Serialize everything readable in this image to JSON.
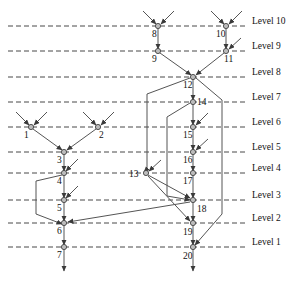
{
  "diagram": {
    "colors": {
      "edge": "#555555",
      "node_fill": "#bdbdbd",
      "node_stroke": "#444444",
      "level_line": "#333333",
      "text": "#111111",
      "background": "#ffffff"
    },
    "levels": [
      {
        "label": "Level 10",
        "y": 26
      },
      {
        "label": "Level 9",
        "y": 51
      },
      {
        "label": "Level 8",
        "y": 77
      },
      {
        "label": "Level 7",
        "y": 102
      },
      {
        "label": "Level 6",
        "y": 127
      },
      {
        "label": "Level 5",
        "y": 152
      },
      {
        "label": "Level 4",
        "y": 173
      },
      {
        "label": "Level 3",
        "y": 200
      },
      {
        "label": "Level 2",
        "y": 223
      },
      {
        "label": "Level 1",
        "y": 247
      }
    ],
    "level_line": {
      "x1": 8,
      "x2": 248,
      "label_x": 252
    },
    "nodes": [
      {
        "id": "1",
        "x": 31,
        "y": 127,
        "label": "1",
        "lx": 24,
        "ly": 130
      },
      {
        "id": "2",
        "x": 98,
        "y": 127,
        "label": "2",
        "lx": 99,
        "ly": 130
      },
      {
        "id": "3",
        "x": 64,
        "y": 152,
        "label": "3",
        "lx": 57,
        "ly": 155
      },
      {
        "id": "4",
        "x": 64,
        "y": 173,
        "label": "4",
        "lx": 57,
        "ly": 176
      },
      {
        "id": "5",
        "x": 64,
        "y": 200,
        "label": "5",
        "lx": 57,
        "ly": 203
      },
      {
        "id": "6",
        "x": 64,
        "y": 223,
        "label": "6",
        "lx": 57,
        "ly": 226
      },
      {
        "id": "7",
        "x": 64,
        "y": 247,
        "label": "7",
        "lx": 57,
        "ly": 250
      },
      {
        "id": "8",
        "x": 158,
        "y": 26,
        "label": "8",
        "lx": 152,
        "ly": 29
      },
      {
        "id": "9",
        "x": 158,
        "y": 51,
        "label": "9",
        "lx": 152,
        "ly": 54
      },
      {
        "id": "10",
        "x": 226,
        "y": 26,
        "label": "10",
        "lx": 216,
        "ly": 29
      },
      {
        "id": "11",
        "x": 226,
        "y": 51,
        "label": "11",
        "lx": 224,
        "ly": 54
      },
      {
        "id": "12",
        "x": 193,
        "y": 77,
        "label": "12",
        "lx": 183,
        "ly": 80
      },
      {
        "id": "13",
        "x": 146,
        "y": 173,
        "label": "13",
        "lx": 129,
        "ly": 169
      },
      {
        "id": "14",
        "x": 193,
        "y": 102,
        "label": "14",
        "lx": 197,
        "ly": 97
      },
      {
        "id": "15",
        "x": 193,
        "y": 127,
        "label": "15",
        "lx": 183,
        "ly": 130
      },
      {
        "id": "16",
        "x": 193,
        "y": 152,
        "label": "16",
        "lx": 183,
        "ly": 155
      },
      {
        "id": "17",
        "x": 193,
        "y": 173,
        "label": "17",
        "lx": 183,
        "ly": 176
      },
      {
        "id": "18",
        "x": 193,
        "y": 200,
        "label": "18",
        "lx": 197,
        "ly": 204
      },
      {
        "id": "19",
        "x": 193,
        "y": 223,
        "label": "19",
        "lx": 183,
        "ly": 227
      },
      {
        "id": "20",
        "x": 193,
        "y": 247,
        "label": "20",
        "lx": 183,
        "ly": 251
      }
    ],
    "stub_edges": [
      {
        "name": "stub-in-1-left",
        "x1": 16,
        "y1": 112,
        "x2": 29,
        "y2": 125
      },
      {
        "name": "stub-in-1-right",
        "x1": 47,
        "y1": 112,
        "x2": 34,
        "y2": 125
      },
      {
        "name": "stub-in-2-left",
        "x1": 83,
        "y1": 112,
        "x2": 96,
        "y2": 125
      },
      {
        "name": "stub-in-2-right",
        "x1": 114,
        "y1": 112,
        "x2": 101,
        "y2": 125
      },
      {
        "name": "stub-in-4",
        "x1": 78,
        "y1": 159,
        "x2": 66,
        "y2": 171
      },
      {
        "name": "stub-in-5",
        "x1": 78,
        "y1": 186,
        "x2": 66,
        "y2": 198
      },
      {
        "name": "stub-in-8-left",
        "x1": 143,
        "y1": 11,
        "x2": 156,
        "y2": 24
      },
      {
        "name": "stub-in-8-right",
        "x1": 174,
        "y1": 11,
        "x2": 161,
        "y2": 24
      },
      {
        "name": "stub-in-10-left",
        "x1": 211,
        "y1": 11,
        "x2": 224,
        "y2": 24
      },
      {
        "name": "stub-in-10-right",
        "x1": 242,
        "y1": 11,
        "x2": 229,
        "y2": 24
      },
      {
        "name": "stub-in-11",
        "x1": 241,
        "y1": 38,
        "x2": 229,
        "y2": 49
      },
      {
        "name": "stub-in-15",
        "x1": 208,
        "y1": 113,
        "x2": 196,
        "y2": 125
      },
      {
        "name": "stub-in-16",
        "x1": 208,
        "y1": 139,
        "x2": 196,
        "y2": 150
      },
      {
        "name": "stub-in-13",
        "x1": 161,
        "y1": 160,
        "x2": 149,
        "y2": 171
      },
      {
        "name": "stub-out-7",
        "x1": 64,
        "y1": 249,
        "x2": 64,
        "y2": 271
      },
      {
        "name": "stub-out-20",
        "x1": 193,
        "y1": 249,
        "x2": 193,
        "y2": 271
      }
    ],
    "edges": [
      {
        "name": "edge-8-9",
        "points": "158,28 158,49"
      },
      {
        "name": "edge-10-11",
        "points": "226,28 226,49"
      },
      {
        "name": "edge-9-12",
        "points": "160,53 191,75"
      },
      {
        "name": "edge-11-12",
        "points": "224,53 196,75"
      },
      {
        "name": "edge-12-14",
        "points": "193,79 193,100"
      },
      {
        "name": "edge-14-15",
        "points": "193,104 193,125"
      },
      {
        "name": "edge-15-16",
        "points": "193,129 193,150"
      },
      {
        "name": "edge-16-17",
        "points": "193,154 193,171"
      },
      {
        "name": "edge-17-18",
        "points": "193,175 193,198"
      },
      {
        "name": "edge-18-19",
        "points": "193,202 193,221"
      },
      {
        "name": "edge-19-20",
        "points": "193,225 193,245"
      },
      {
        "name": "edge-1-3",
        "points": "33,129 62,150"
      },
      {
        "name": "edge-2-3",
        "points": "96,129 67,150"
      },
      {
        "name": "edge-3-4",
        "points": "64,154 64,171"
      },
      {
        "name": "edge-4-5",
        "points": "64,175 64,198"
      },
      {
        "name": "edge-5-6",
        "points": "64,202 64,221"
      },
      {
        "name": "edge-6-7",
        "points": "64,225 64,245"
      },
      {
        "name": "edge-4-6-bend",
        "points": "62,175 36,181 36,214 62,224"
      },
      {
        "name": "edge-12-13-bend",
        "points": "190,78 147,94 147,169 144,172"
      },
      {
        "name": "edge-14-18-bend",
        "points": "190,103 167,117 167,196 190,200"
      },
      {
        "name": "edge-12-20-bend",
        "points": "196,78 222,100 222,214 195,245"
      },
      {
        "name": "edge-13-18",
        "points": "148,175 190,198"
      },
      {
        "name": "edge-13-19",
        "points": "148,176 190,221"
      },
      {
        "name": "edge-18-6",
        "points": "190,202 68,222"
      }
    ]
  }
}
